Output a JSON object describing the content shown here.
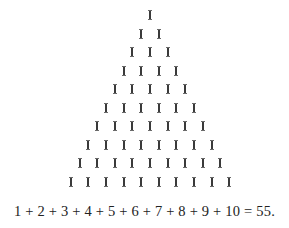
{
  "figure": {
    "rows": 10,
    "glyph": "I",
    "row_counts": [
      1,
      2,
      3,
      4,
      5,
      6,
      7,
      8,
      9,
      10
    ],
    "apex_x": 150,
    "top_y": 10,
    "row_spacing": 18.5,
    "col_spacing": 17.6,
    "color": "#3a3a3a"
  },
  "equation": {
    "text": "1 + 2 + 3 + 4 + 5 + 6 + 7 + 8 + 9 + 10 = 55."
  }
}
